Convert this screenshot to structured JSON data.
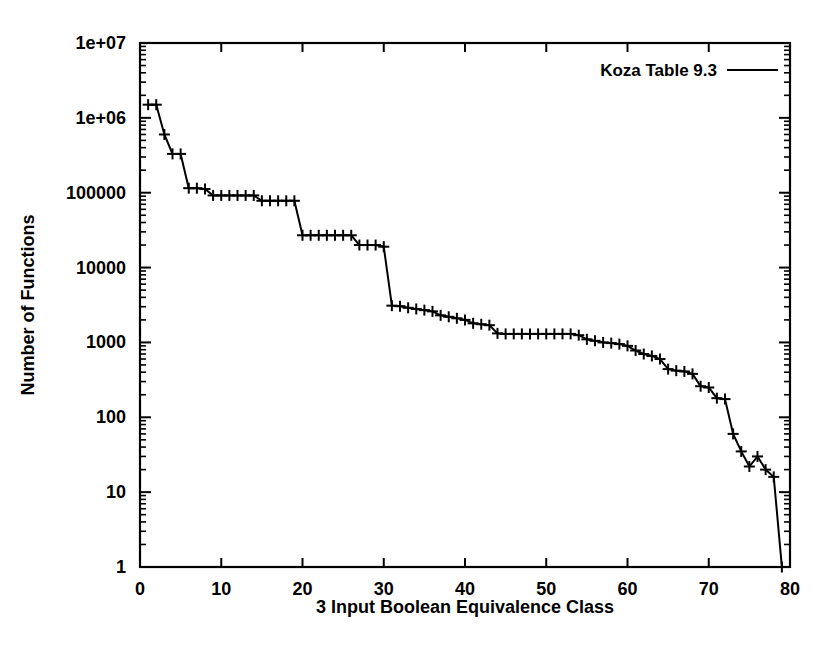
{
  "chart_data": {
    "type": "line",
    "title": "",
    "xlabel": "3 Input Boolean Equivalence Class",
    "ylabel": "Number of Functions",
    "xlim": [
      0,
      80
    ],
    "ylim": [
      1,
      10000000
    ],
    "yscale": "log",
    "xscale": "linear",
    "grid": false,
    "legend_position": "top-right",
    "xticks": [
      0,
      10,
      20,
      30,
      40,
      50,
      60,
      70,
      80
    ],
    "xtick_labels": [
      "0",
      "10",
      "20",
      "30",
      "40",
      "50",
      "60",
      "70",
      "80"
    ],
    "yticks": [
      1,
      10,
      100,
      1000,
      10000,
      100000,
      1000000,
      10000000
    ],
    "ytick_labels": [
      "1",
      "10",
      "100",
      "1000",
      "10000",
      "100000",
      "1e+06",
      "1e+07"
    ],
    "marker_style": "plus",
    "series": [
      {
        "name": "Koza Table 9.3",
        "color": "#000000",
        "x": [
          1,
          2,
          3,
          4,
          5,
          6,
          7,
          8,
          9,
          10,
          11,
          12,
          13,
          14,
          15,
          16,
          17,
          18,
          19,
          20,
          21,
          22,
          23,
          24,
          25,
          26,
          27,
          28,
          29,
          30,
          31,
          32,
          33,
          34,
          35,
          36,
          37,
          38,
          39,
          40,
          41,
          42,
          43,
          44,
          45,
          46,
          47,
          48,
          49,
          50,
          51,
          52,
          53,
          54,
          55,
          56,
          57,
          58,
          59,
          60,
          61,
          62,
          63,
          64,
          65,
          66,
          67,
          68,
          69,
          70,
          71,
          72,
          73,
          74,
          75,
          76,
          77,
          78,
          79
        ],
        "y": [
          1500000,
          1500000,
          600000,
          330000,
          330000,
          115000,
          115000,
          112000,
          92000,
          92000,
          92000,
          92000,
          92000,
          92000,
          78000,
          78000,
          78000,
          78000,
          78000,
          27000,
          27000,
          27000,
          27000,
          27000,
          27000,
          27000,
          20000,
          20000,
          20000,
          19000,
          3100,
          3050,
          2900,
          2800,
          2700,
          2600,
          2300,
          2200,
          2100,
          2000,
          1800,
          1750,
          1700,
          1320,
          1300,
          1300,
          1300,
          1300,
          1300,
          1300,
          1300,
          1300,
          1300,
          1250,
          1100,
          1050,
          1000,
          980,
          950,
          900,
          780,
          700,
          660,
          600,
          440,
          420,
          410,
          380,
          260,
          250,
          180,
          175,
          60,
          35,
          22,
          30,
          20,
          16,
          1
        ],
        "ydatalabels": []
      }
    ]
  },
  "legend": {
    "entries": [
      {
        "label": "Koza Table 9.3",
        "sample": "line"
      }
    ]
  },
  "axes": {
    "x_title": "3 Input Boolean Equivalence Class",
    "y_title": "Number of Functions"
  }
}
